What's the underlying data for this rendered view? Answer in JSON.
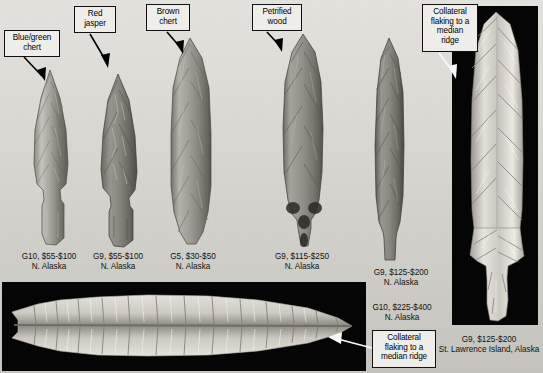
{
  "figure": {
    "background_color": "#dedcd6",
    "panel_background_color": "#050505"
  },
  "callouts": [
    {
      "id": "blue-green-chert",
      "text": "Blue/green\nchert",
      "lines": [
        "Blue/green",
        "chert"
      ]
    },
    {
      "id": "red-jasper",
      "text": "Red\njasper",
      "lines": [
        "Red",
        "jasper"
      ]
    },
    {
      "id": "brown-chert",
      "text": "Brown\nchert",
      "lines": [
        "Brown",
        "chert"
      ]
    },
    {
      "id": "petrified-wood",
      "text": "Petrified\nwood",
      "lines": [
        "Petrified",
        "wood"
      ]
    },
    {
      "id": "collateral-flaking-top-right",
      "text": "Collateral\nflaking to a\nmedian\nridge",
      "lines": [
        "Collateral",
        "flaking to a",
        "median",
        "ridge"
      ]
    },
    {
      "id": "collateral-flaking-bottom",
      "text": "Collateral\nflaking to a\nmedian ridge",
      "lines": [
        "Collateral",
        "flaking to a",
        "median ridge"
      ]
    }
  ],
  "captions": [
    {
      "id": "caption-1",
      "grade_price": "G10, $55-$100",
      "locality": "N. Alaska"
    },
    {
      "id": "caption-2",
      "grade_price": "G9, $55-$100",
      "locality": "N. Alaska"
    },
    {
      "id": "caption-3",
      "grade_price": "G5, $30-$50",
      "locality": "N. Alaska"
    },
    {
      "id": "caption-4",
      "grade_price": "G9, $115-$250",
      "locality": "N. Alaska"
    },
    {
      "id": "caption-5",
      "grade_price": "G9, $125-$200",
      "locality": "N. Alaska"
    },
    {
      "id": "caption-6",
      "grade_price": "G10, $225-$400",
      "locality": "N. Alaska"
    },
    {
      "id": "caption-7",
      "grade_price": "G9, $125-$200",
      "locality": "St. Lawrence Island, Alaska"
    }
  ],
  "artifacts": [
    {
      "id": "point-1",
      "material": "Blue/green chert",
      "form": "stemmed lanceolate",
      "caption_ref": "caption-1"
    },
    {
      "id": "point-2",
      "material": "Red jasper",
      "form": "stemmed lanceolate",
      "caption_ref": "caption-2"
    },
    {
      "id": "point-3",
      "material": "Brown chert",
      "form": "long lanceolate blade",
      "caption_ref": "caption-3"
    },
    {
      "id": "point-4",
      "material": "Petrified wood",
      "form": "stemmed lanceolate",
      "caption_ref": "caption-4"
    },
    {
      "id": "point-5",
      "material": "grey chert",
      "form": "narrow lanceolate",
      "caption_ref": "caption-5"
    },
    {
      "id": "point-6",
      "material": "white chalcedony",
      "form": "large collaterally flaked lanceolate, edge view",
      "caption_ref": "caption-6"
    },
    {
      "id": "point-7",
      "material": "white chalcedony",
      "form": "stemmed point",
      "caption_ref": "caption-7"
    }
  ]
}
